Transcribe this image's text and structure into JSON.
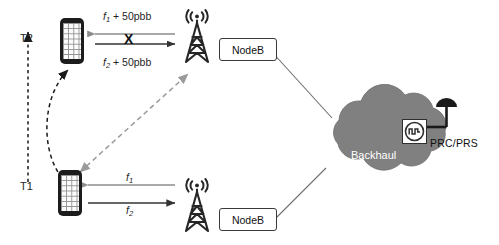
{
  "diagram": {
    "colors": {
      "cloud_fill": "#808080",
      "cloud_text": "#ffffff",
      "tower": "#262626",
      "arrow_dark": "#333333",
      "arrow_gray": "#8c8c8c",
      "dashed_black": "#1a1a1a",
      "dashed_gray": "#9a9a9a",
      "box_border": "#3a3a3a",
      "phone_body": "#1c1c1c",
      "antenna": "#1a1a1a"
    },
    "time_axis": {
      "name": "time-axis",
      "start_label": "T1",
      "end_label": "T2",
      "direction": "upward"
    },
    "devices": [
      {
        "id": "ue-t2",
        "type": "smartphone",
        "time": "T2",
        "position": "top-left"
      },
      {
        "id": "ue-t1",
        "type": "smartphone",
        "time": "T1",
        "position": "bottom-left"
      }
    ],
    "movement": {
      "name": "handover-motion",
      "from": "T1",
      "to": "T2",
      "style": "curved-dashed-arrow"
    },
    "base_stations": [
      {
        "id": "nodeb-top",
        "label": "NodeB",
        "position": "top"
      },
      {
        "id": "nodeb-bottom",
        "label": "NodeB",
        "position": "bottom"
      }
    ],
    "links": {
      "top": {
        "name": "blocked-link",
        "blocked": true,
        "block_marker": "X",
        "downlink": {
          "label_base": "f",
          "sub": "1",
          "offset": " + 50pbb",
          "direction": "left"
        },
        "uplink": {
          "label_base": "f",
          "sub": "2",
          "offset": " + 50pbb",
          "direction": "right"
        }
      },
      "bottom": {
        "name": "active-link",
        "blocked": false,
        "downlink": {
          "label_base": "f",
          "sub": "1",
          "offset": "",
          "direction": "left"
        },
        "uplink": {
          "label_base": "f",
          "sub": "2",
          "offset": "",
          "direction": "right"
        }
      },
      "measurement": {
        "name": "measurement-link",
        "style": "double-headed-dashed",
        "from": "ue-t1",
        "to": "nodeb-top"
      },
      "backhaul_links": [
        {
          "from": "nodeb-top",
          "to": "backhaul-cloud"
        },
        {
          "from": "nodeb-bottom",
          "to": "backhaul-cloud"
        }
      ]
    },
    "cloud": {
      "name": "backhaul-cloud",
      "label": "Backhaul"
    },
    "reference_clock": {
      "name": "prc-prs",
      "label": "PRC/PRS",
      "icon": "pulse-clock-icon",
      "antenna": "dome-antenna-icon"
    }
  }
}
